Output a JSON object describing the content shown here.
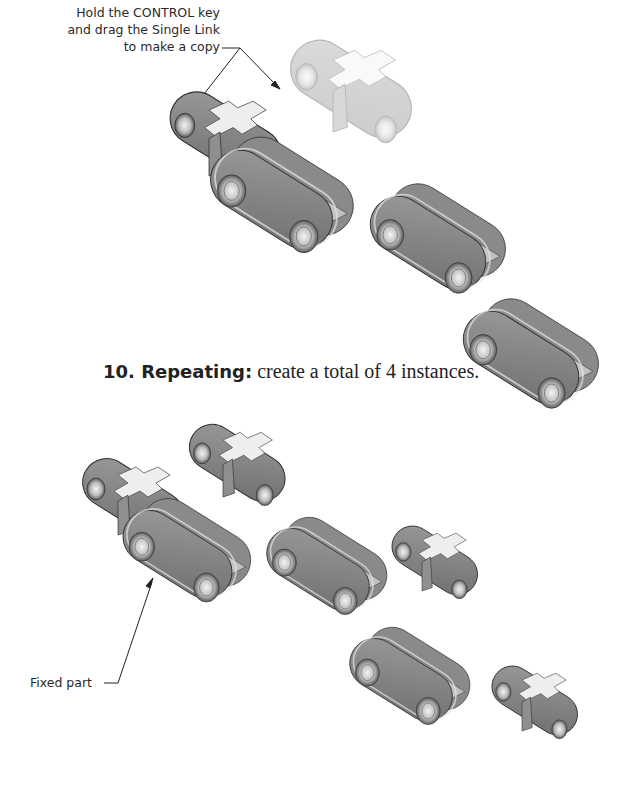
{
  "callouts": {
    "top": {
      "line1": "Hold the CONTROL key",
      "line2": "and drag the Single Link",
      "line3": "to make a copy"
    },
    "bottom": {
      "label": "Fixed part"
    }
  },
  "step": {
    "number_label": "10. Repeating:",
    "text": " create a total of 4 instances."
  },
  "illustrations": {
    "top_section": [
      {
        "name": "assembled-links",
        "description": "Double link with single link attached (fixed part)"
      },
      {
        "name": "single-link-copy-transparent",
        "description": "Single link being dragged copy (transparent)"
      },
      {
        "name": "double-link-1",
        "description": "Double link"
      },
      {
        "name": "double-link-2",
        "description": "Double link"
      }
    ],
    "bottom_section": [
      {
        "name": "assembled-links-fixed",
        "description": "Fixed part assembly"
      },
      {
        "name": "single-link-1",
        "description": "Single link instance"
      },
      {
        "name": "double-link-a",
        "description": "Double link"
      },
      {
        "name": "single-link-2",
        "description": "Single link instance"
      },
      {
        "name": "double-link-b",
        "description": "Double link"
      },
      {
        "name": "single-link-3",
        "description": "Single link instance"
      }
    ]
  },
  "colors": {
    "part_face": "#7d7d7d",
    "part_edge": "#d9d9d9",
    "part_dark": "#555555",
    "text": "#222222"
  }
}
